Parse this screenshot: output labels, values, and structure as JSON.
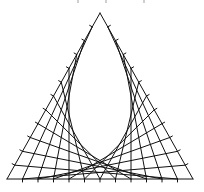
{
  "figure": {
    "type": "curve-stitching-triangle",
    "divisions": 12,
    "stroke_color": "#111111",
    "stroke_width": 1,
    "tick_length": 3,
    "vertices": {
      "apex": [
        100,
        13
      ],
      "bottom_left": [
        7,
        179
      ],
      "bottom_right": [
        193,
        179
      ]
    },
    "top_fragments_x": [
      77,
      105,
      143
    ]
  }
}
